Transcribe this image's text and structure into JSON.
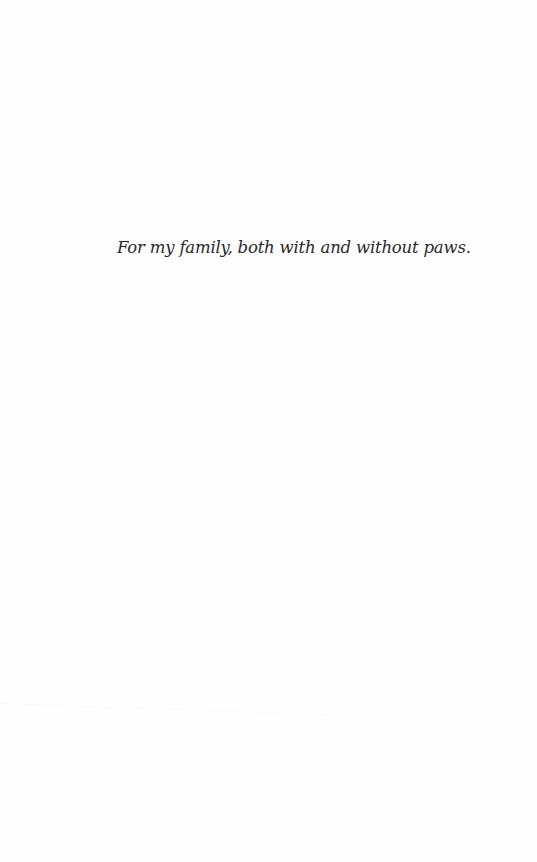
{
  "page": {
    "background_color": "#fefefe",
    "text_color": "#2a2a2a"
  },
  "dedication": {
    "text": "For my family, both with and without paws."
  }
}
